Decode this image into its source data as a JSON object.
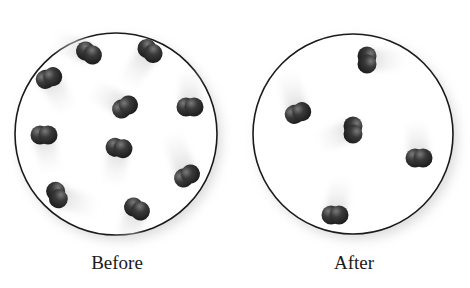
{
  "panels": [
    {
      "label": "Before",
      "cx": 116,
      "cy": 134,
      "r": 101,
      "molecules": [
        {
          "x": 89,
          "y": 53,
          "angle": 30,
          "trail": 40,
          "trail_angle": 200
        },
        {
          "x": 150,
          "y": 51,
          "angle": 40,
          "trail": 45,
          "trail_angle": 125
        },
        {
          "x": 49,
          "y": 78,
          "angle": -20,
          "trail": 40,
          "trail_angle": 60
        },
        {
          "x": 125,
          "y": 107,
          "angle": -30,
          "trail": 40,
          "trail_angle": 210
        },
        {
          "x": 190,
          "y": 107,
          "angle": 0,
          "trail": 40,
          "trail_angle": 270
        },
        {
          "x": 44,
          "y": 135,
          "angle": 0,
          "trail": 40,
          "trail_angle": 80
        },
        {
          "x": 119,
          "y": 148,
          "angle": 10,
          "trail": 40,
          "trail_angle": 100
        },
        {
          "x": 187,
          "y": 176,
          "angle": -30,
          "trail": 50,
          "trail_angle": 250
        },
        {
          "x": 57,
          "y": 195,
          "angle": 70,
          "trail": 45,
          "trail_angle": 20
        },
        {
          "x": 137,
          "y": 209,
          "angle": 30,
          "trail": 40,
          "trail_angle": 110
        }
      ]
    },
    {
      "label": "After",
      "cx": 353,
      "cy": 134,
      "r": 100,
      "molecules": [
        {
          "x": 367,
          "y": 60,
          "angle": 90,
          "trail": 40,
          "trail_angle": 0
        },
        {
          "x": 298,
          "y": 113,
          "angle": -20,
          "trail": 45,
          "trail_angle": 255
        },
        {
          "x": 353,
          "y": 130,
          "angle": 90,
          "trail": 40,
          "trail_angle": 160
        },
        {
          "x": 419,
          "y": 158,
          "angle": 0,
          "trail": 40,
          "trail_angle": 265
        },
        {
          "x": 335,
          "y": 215,
          "angle": 0,
          "trail": 40,
          "trail_angle": 280
        }
      ]
    }
  ],
  "colors": {
    "circle_stroke": "#1a1a1a",
    "atom_dark": "#2b2b2b",
    "atom_light": "#6a6a6a",
    "trail": "#d8d8d8",
    "label": "#1a1a1a"
  }
}
